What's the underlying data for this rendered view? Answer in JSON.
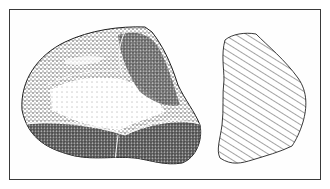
{
  "figure": {
    "views": [
      {
        "name": "stippled-view",
        "description": "stippled drawing of stone core"
      },
      {
        "name": "cross-section",
        "description": "hatched cross-section outline"
      }
    ],
    "colors": {
      "ink": "#1e1e1e",
      "paper": "#ffffff",
      "border": "#3a3a3a"
    }
  }
}
